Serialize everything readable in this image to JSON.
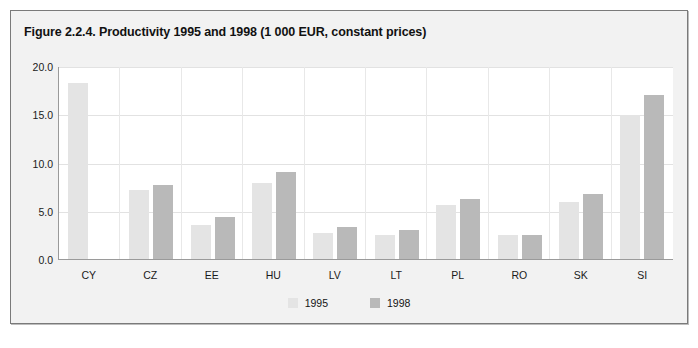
{
  "figure": {
    "title": "Figure 2.2.4. Productivity 1995 and 1998 (1 000 EUR, constant prices)"
  },
  "colors": {
    "series_1995": "#e4e4e4",
    "series_1998": "#b9b9b9",
    "panel_background": "#f2f2f2",
    "plot_background": "#ffffff",
    "gridline": "#e2e2e2",
    "axis": "#9a9a9a",
    "border": "#7a7a7a",
    "text": "#1a1a1a"
  },
  "chart_data": {
    "type": "bar",
    "title": "Figure 2.2.4. Productivity 1995 and 1998 (1 000 EUR, constant prices)",
    "xlabel": "",
    "ylabel": "",
    "ylim": [
      0.0,
      20.0
    ],
    "yticks": [
      0.0,
      5.0,
      10.0,
      15.0,
      20.0
    ],
    "ytick_labels": [
      "0.0",
      "5.0",
      "10.0",
      "15.0",
      "20.0"
    ],
    "grid": true,
    "legend_position": "bottom-center",
    "categories": [
      "CY",
      "CZ",
      "EE",
      "HU",
      "LV",
      "LT",
      "PL",
      "RO",
      "SK",
      "SI"
    ],
    "series": [
      {
        "name": "1995",
        "color": "#e4e4e4",
        "values": [
          18.2,
          7.2,
          3.5,
          7.9,
          2.7,
          2.5,
          5.6,
          2.5,
          5.9,
          14.9
        ]
      },
      {
        "name": "1998",
        "color": "#b9b9b9",
        "values": [
          null,
          7.7,
          4.4,
          9.0,
          3.3,
          3.0,
          6.2,
          2.5,
          6.7,
          17.0
        ]
      }
    ]
  },
  "legend": {
    "items": [
      {
        "label": "1995",
        "color": "#e4e4e4"
      },
      {
        "label": "1998",
        "color": "#b9b9b9"
      }
    ]
  }
}
